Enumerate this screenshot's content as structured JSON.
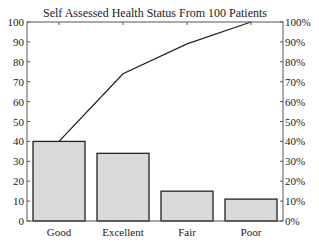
{
  "chart_data": {
    "type": "bar",
    "title": "Self Assessed Health Status From 100 Patients",
    "categories": [
      "Good",
      "Excellent",
      "Fair",
      "Poor"
    ],
    "values": [
      40,
      34,
      15,
      11
    ],
    "series": [
      {
        "name": "Count",
        "type": "bar",
        "axis": "left",
        "values": [
          40,
          34,
          15,
          11
        ]
      },
      {
        "name": "Cumulative %",
        "type": "line",
        "axis": "right",
        "values": [
          40,
          74,
          89,
          100
        ]
      }
    ],
    "xlabel": "",
    "ylabel": "",
    "ylim": [
      0,
      100
    ],
    "y2lim": [
      0,
      100
    ],
    "yticks": [
      "0",
      "10",
      "20",
      "30",
      "40",
      "50",
      "60",
      "70",
      "80",
      "90",
      "100"
    ],
    "y2ticks": [
      "0%",
      "10%",
      "20%",
      "30%",
      "40%",
      "50%",
      "60%",
      "70%",
      "80%",
      "90%",
      "100%"
    ],
    "grid": false,
    "legend": null,
    "colors": {
      "bar_fill": "#d9d9d9",
      "bar_edge": "#222222",
      "line": "#222222"
    }
  }
}
